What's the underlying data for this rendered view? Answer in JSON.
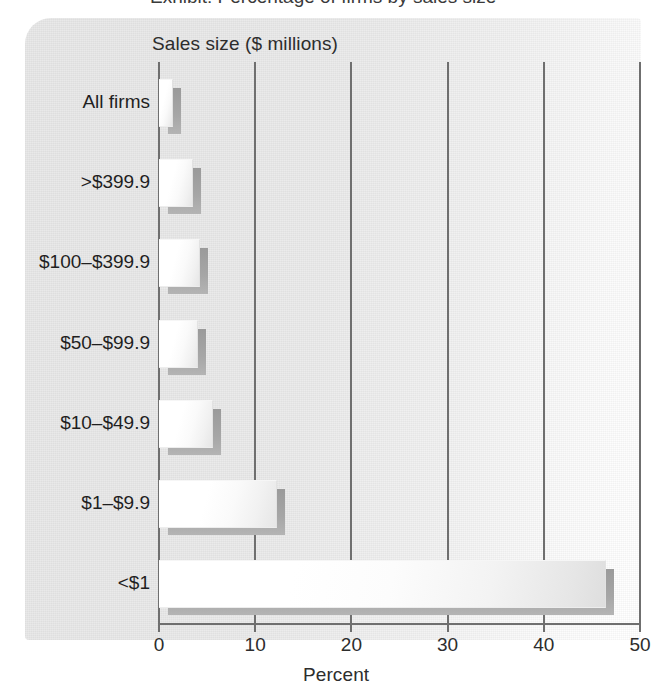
{
  "caption_remnant": "Exhibit: Percentage of firms by sales size",
  "chart_data": {
    "type": "bar",
    "orientation": "horizontal",
    "title": "",
    "ylabel": "Sales size ($ millions)",
    "xlabel": "Percent",
    "categories": [
      "All firms",
      ">$399.9",
      "$100–$399.9",
      "$50–$99.9",
      "$10–$49.9",
      "$1–$9.9",
      "<$1"
    ],
    "values": [
      1.3,
      3.4,
      4.2,
      4.0,
      5.5,
      12.2,
      46.4
    ],
    "xlim": [
      0,
      50
    ],
    "xticks": [
      0,
      10,
      20,
      30,
      40,
      50
    ],
    "xtick_labels": [
      "0",
      "10",
      "20",
      "30",
      "40",
      "50"
    ],
    "grid": "vertical",
    "legend": "none",
    "bar_style": "white-3d-with-drop-shadow",
    "colors": {
      "bar_fill": "#ffffff",
      "bar_shadow": "#a6a6a6",
      "axis": "#6f6f6f",
      "panel_background": "#ececec",
      "text": "#2d2d2d"
    }
  }
}
